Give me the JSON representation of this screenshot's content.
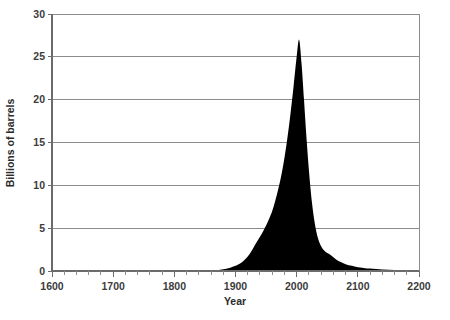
{
  "chart_data": {
    "type": "area",
    "title": "",
    "xlabel": "Year",
    "ylabel": "Billions of barrels",
    "xlim": [
      1600,
      2200
    ],
    "ylim": [
      0,
      30
    ],
    "grid": true,
    "legend": false,
    "legend_position": "none",
    "series_color": "#000000",
    "grid_color": "#8c8c8c",
    "axis_color": "#6b6b6b",
    "x_ticks": [
      1600,
      1700,
      1800,
      1900,
      2000,
      2100,
      2200
    ],
    "x_tick_labels": [
      "1600",
      "1700",
      "1800",
      "1900",
      "2000",
      "2100",
      "2200"
    ],
    "x_minor_tick_step": 20,
    "y_ticks": [
      0,
      5,
      10,
      15,
      20,
      25,
      30
    ],
    "y_tick_labels": [
      "0",
      "5",
      "10",
      "15",
      "20",
      "25",
      "30"
    ],
    "peak": {
      "x": 2004,
      "y": 27
    },
    "series": [
      {
        "name": "Oil volume",
        "x": [
          1600,
          1700,
          1800,
          1840,
          1860,
          1870,
          1880,
          1890,
          1900,
          1905,
          1910,
          1915,
          1920,
          1925,
          1930,
          1935,
          1940,
          1945,
          1950,
          1955,
          1960,
          1965,
          1970,
          1975,
          1980,
          1985,
          1990,
          1995,
          2000,
          2004,
          2008,
          2012,
          2016,
          2020,
          2025,
          2030,
          2035,
          2040,
          2045,
          2050,
          2055,
          2060,
          2065,
          2070,
          2080,
          2090,
          2100,
          2120,
          2140,
          2160,
          2180,
          2200
        ],
        "values": [
          0,
          0,
          0,
          0,
          0.05,
          0.1,
          0.2,
          0.35,
          0.6,
          0.8,
          1.0,
          1.3,
          1.7,
          2.2,
          2.8,
          3.4,
          4.0,
          4.6,
          5.3,
          6.1,
          7.0,
          8.2,
          9.6,
          11.2,
          13.2,
          15.6,
          18.4,
          21.6,
          25.0,
          27.0,
          24.2,
          20.0,
          15.6,
          11.8,
          8.0,
          5.4,
          3.8,
          2.9,
          2.4,
          2.1,
          1.9,
          1.6,
          1.3,
          1.1,
          0.8,
          0.6,
          0.45,
          0.28,
          0.18,
          0.12,
          0.07,
          0.04
        ]
      }
    ]
  },
  "axes": {
    "y_title": "Billions of barrels",
    "x_title": "Year"
  }
}
